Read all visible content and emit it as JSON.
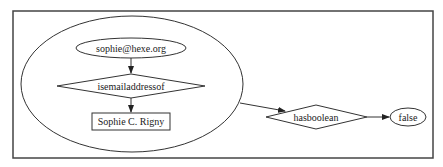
{
  "diagram": {
    "frame": {
      "x": 13,
      "y": 11,
      "width": 420,
      "height": 147
    },
    "cluster": {
      "shape": "ellipse",
      "cx": 132,
      "cy": 84,
      "rx": 111,
      "ry": 68
    },
    "nodes": [
      {
        "id": "email",
        "label": "sophie@hexe.org",
        "shape": "ellipse",
        "cx": 131,
        "cy": 48,
        "rx": 55,
        "ry": 10
      },
      {
        "id": "isemailaddressof",
        "label": "isemailaddressof",
        "shape": "diamond",
        "cx": 131,
        "cy": 86,
        "hw": 74,
        "hh": 12
      },
      {
        "id": "person",
        "label": "Sophie C. Rigny",
        "shape": "rect",
        "x": 92,
        "y": 113,
        "width": 78,
        "height": 17
      },
      {
        "id": "hasboolean",
        "label": "hasboolean",
        "shape": "diamond",
        "cx": 316,
        "cy": 117,
        "hw": 50,
        "hh": 12
      },
      {
        "id": "false",
        "label": "false",
        "shape": "ellipse",
        "cx": 408,
        "cy": 117,
        "rx": 18,
        "ry": 9
      }
    ],
    "edges": [
      {
        "from": "email",
        "to": "isemailaddressof"
      },
      {
        "from": "isemailaddressof",
        "to": "person"
      },
      {
        "from": "cluster",
        "to": "hasboolean"
      },
      {
        "from": "hasboolean",
        "to": "false"
      }
    ],
    "colors": {
      "line": "#333333",
      "background": "#ffffff",
      "text": "#222222"
    }
  }
}
